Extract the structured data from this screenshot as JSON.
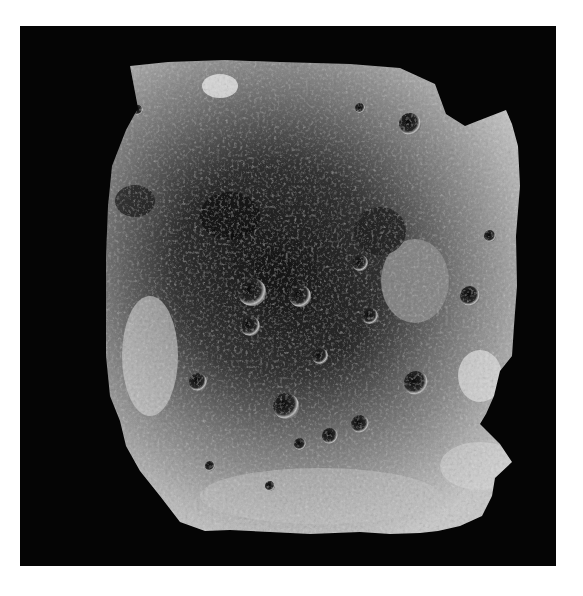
{
  "image": {
    "subject": "lunar south pole mosaic",
    "style": "grayscale",
    "background_color": "#ffffff",
    "frame_color": "#050505",
    "surface_light": "#d8d8d8",
    "surface_mid": "#9a9a9a",
    "surface_dark": "#1e1e1e"
  }
}
